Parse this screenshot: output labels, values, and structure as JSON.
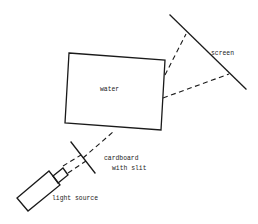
{
  "diagram": {
    "type": "experimental-setup",
    "labels": {
      "water": "water",
      "screen": "screen",
      "cardboard_line1": "cardboard",
      "cardboard_line2": "with slit",
      "light_source": "light source"
    },
    "components": [
      {
        "id": "light-source",
        "label": "light source"
      },
      {
        "id": "cardboard",
        "label": "cardboard with slit"
      },
      {
        "id": "water",
        "label": "water"
      },
      {
        "id": "screen",
        "label": "screen"
      }
    ],
    "colors": {
      "stroke": "#1a1a1a",
      "background": "#ffffff"
    }
  }
}
